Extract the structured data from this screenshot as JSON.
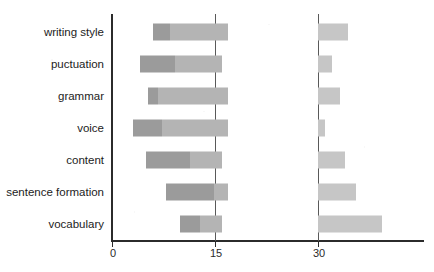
{
  "chart_data": {
    "type": "bar",
    "orientation": "horizontal",
    "title": "",
    "xlabel": "",
    "ylabel": "",
    "xlim": [
      0,
      45.5
    ],
    "xticks": [
      0,
      15,
      30
    ],
    "xticklabels": [
      "0",
      "15",
      "30"
    ],
    "grid": "vertical gridlines at 15 and 30",
    "legend": "none",
    "stacked_floating": true,
    "note": "Each category is drawn as a floating/offset bar: a left cluster of two adjacent segments plus a separate segment that starts at x=30.",
    "categories": [
      "writing style",
      "puctuation",
      "grammar",
      "voice",
      "content",
      "sentence formation",
      "vocabulary"
    ],
    "segments": [
      {
        "category": "writing style",
        "a_start": 6.0,
        "a_end": 8.5,
        "b_start": 8.5,
        "b_end": 16.9,
        "c_start": 30,
        "c_end": 34.4
      },
      {
        "category": "puctuation",
        "a_start": 4.1,
        "a_end": 9.2,
        "b_start": 9.2,
        "b_end": 16.0,
        "c_start": 30,
        "c_end": 32.0
      },
      {
        "category": "grammar",
        "a_start": 5.2,
        "a_end": 6.7,
        "b_start": 6.7,
        "b_end": 16.9,
        "c_start": 30,
        "c_end": 33.2
      },
      {
        "category": "voice",
        "a_start": 3.1,
        "a_end": 7.3,
        "b_start": 7.3,
        "b_end": 16.9,
        "c_start": 30,
        "c_end": 31.0
      },
      {
        "category": "content",
        "a_start": 5.0,
        "a_end": 11.4,
        "b_start": 11.4,
        "b_end": 16.0,
        "c_start": 30,
        "c_end": 34.0
      },
      {
        "category": "sentence formation",
        "a_start": 7.9,
        "a_end": 14.9,
        "b_start": 14.9,
        "b_end": 16.9,
        "c_start": 30,
        "c_end": 35.5
      },
      {
        "category": "vocabulary",
        "a_start": 9.9,
        "a_end": 12.8,
        "b_start": 12.8,
        "b_end": 16.0,
        "c_start": 30,
        "c_end": 39.3
      }
    ],
    "series": [
      {
        "name": "segment-a",
        "values": [
          2.5,
          5.1,
          1.5,
          4.2,
          6.4,
          7.0,
          2.9
        ]
      },
      {
        "name": "segment-b",
        "values": [
          8.4,
          6.8,
          10.2,
          9.6,
          4.6,
          2.0,
          3.2
        ]
      },
      {
        "name": "segment-c",
        "values": [
          4.4,
          2.0,
          3.2,
          1.0,
          4.0,
          5.5,
          9.3
        ]
      }
    ],
    "colors": {
      "segment_a": "#9b9b9b",
      "segment_b": "#b4b4b4",
      "segment_c": "#c6c6c6",
      "axis": "#2b2b2b",
      "gridline": "#595959",
      "background": "#ffffff",
      "label_text": "#1c1c1c"
    }
  }
}
